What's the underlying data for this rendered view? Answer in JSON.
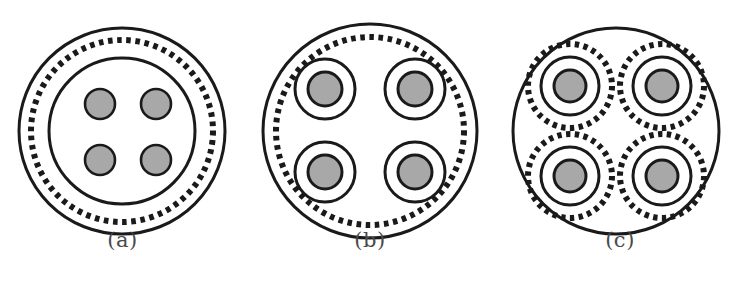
{
  "figure": {
    "type": "technical-cross-section-diagram",
    "background_color": "#ffffff",
    "stroke_color": "#1a1a1a",
    "conductor_fill_color": "#a8a8a8",
    "caption_color": "#4a4a4a",
    "panel_count": 3
  },
  "panels": [
    {
      "id": "panel-a",
      "caption": "(a)",
      "center_x": 122,
      "center_y": 131,
      "caption_y": 243,
      "description": "Four bare conductors inside a single inner sheath, surrounded by one common braided shield between outer jacket and inner sheath",
      "rings": [
        {
          "name": "outer-jacket",
          "radius": 103,
          "style": "solid",
          "stroke_width": 3
        },
        {
          "name": "common-braid-shield",
          "radius": 91,
          "style": "dashed",
          "stroke_width": 6,
          "dash_count": 62
        },
        {
          "name": "inner-sheath",
          "radius": 73,
          "style": "solid",
          "stroke_width": 3
        }
      ],
      "conductors": [
        {
          "name": "conductor-top-left",
          "cx": -22,
          "cy": -27,
          "core_radius": 15,
          "layers": [
            "core"
          ]
        },
        {
          "name": "conductor-top-right",
          "cx": 34,
          "cy": -27,
          "core_radius": 15,
          "layers": [
            "core"
          ]
        },
        {
          "name": "conductor-bottom-left",
          "cx": -22,
          "cy": 29,
          "core_radius": 15,
          "layers": [
            "core"
          ]
        },
        {
          "name": "conductor-bottom-right",
          "cx": 34,
          "cy": 29,
          "core_radius": 15,
          "layers": [
            "core"
          ]
        }
      ]
    },
    {
      "id": "panel-b",
      "caption": "(b)",
      "center_x": 370,
      "center_y": 131,
      "caption_y": 243,
      "description": "Four individually sheathed conductors sharing one common braided shield just inside the outer jacket",
      "rings": [
        {
          "name": "outer-jacket",
          "radius": 107,
          "style": "solid",
          "stroke_width": 3
        },
        {
          "name": "common-braid-shield",
          "radius": 94,
          "style": "dashed",
          "stroke_width": 6,
          "dash_count": 64
        }
      ],
      "conductors": [
        {
          "name": "conductor-top-left",
          "cx": -45,
          "cy": -42,
          "core_radius": 17,
          "sheath_radius": 30,
          "layers": [
            "core",
            "sheath"
          ]
        },
        {
          "name": "conductor-top-right",
          "cx": 45,
          "cy": -42,
          "core_radius": 17,
          "sheath_radius": 30,
          "layers": [
            "core",
            "sheath"
          ]
        },
        {
          "name": "conductor-bottom-left",
          "cx": -45,
          "cy": 41,
          "core_radius": 17,
          "sheath_radius": 30,
          "layers": [
            "core",
            "sheath"
          ]
        },
        {
          "name": "conductor-bottom-right",
          "cx": 45,
          "cy": 41,
          "core_radius": 17,
          "sheath_radius": 30,
          "layers": [
            "core",
            "sheath"
          ]
        }
      ]
    },
    {
      "id": "panel-c",
      "caption": "(c)",
      "center_x": 616,
      "center_y": 131,
      "caption_y": 243,
      "description": "Four individually shielded conductors, each with its own braided shield and sheath, inside a common outer jacket",
      "rings": [
        {
          "name": "outer-jacket",
          "radius": 103,
          "style": "solid",
          "stroke_width": 3
        }
      ],
      "conductors": [
        {
          "name": "conductor-top-left",
          "cx": -46,
          "cy": -45,
          "core_radius": 16,
          "sheath_radius": 29,
          "shield_radius": 42,
          "shield_dash_count": 30,
          "layers": [
            "core",
            "sheath",
            "individual-braid-shield"
          ]
        },
        {
          "name": "conductor-top-right",
          "cx": 46,
          "cy": -45,
          "core_radius": 16,
          "sheath_radius": 29,
          "shield_radius": 42,
          "shield_dash_count": 30,
          "layers": [
            "core",
            "sheath",
            "individual-braid-shield"
          ]
        },
        {
          "name": "conductor-bottom-left",
          "cx": -46,
          "cy": 45,
          "core_radius": 16,
          "sheath_radius": 29,
          "shield_radius": 42,
          "shield_dash_count": 30,
          "layers": [
            "core",
            "sheath",
            "individual-braid-shield"
          ]
        },
        {
          "name": "conductor-bottom-right",
          "cx": 46,
          "cy": 45,
          "core_radius": 16,
          "sheath_radius": 29,
          "shield_radius": 42,
          "shield_dash_count": 30,
          "layers": [
            "core",
            "sheath",
            "individual-braid-shield"
          ]
        }
      ]
    }
  ]
}
